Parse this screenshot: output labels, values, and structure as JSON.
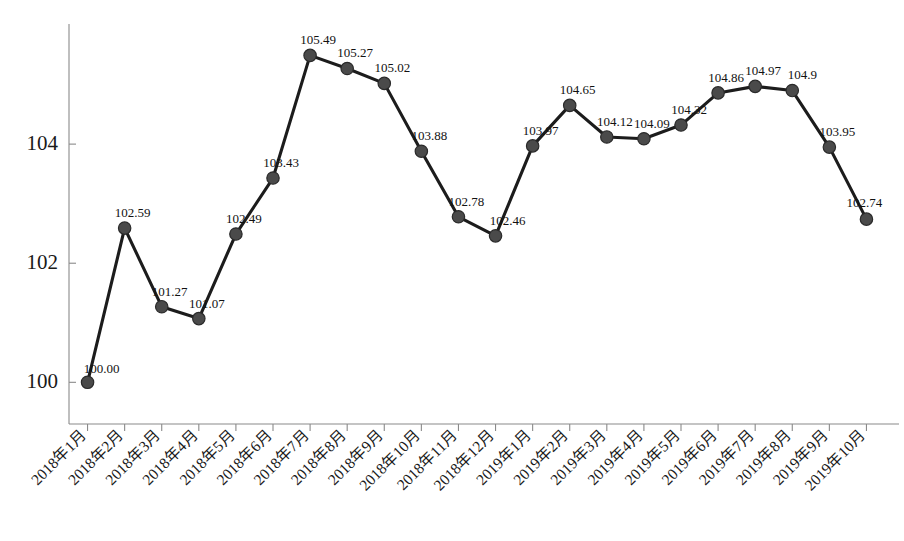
{
  "chart_data": {
    "type": "line",
    "title": "",
    "subtitle": "",
    "xlabel": "",
    "ylabel": "",
    "ylim": [
      99.3,
      105.95
    ],
    "yticks": [
      "100",
      "102",
      "104"
    ],
    "ytick_values": [
      100,
      102,
      104
    ],
    "grid": false,
    "legend": null,
    "legend_position": "none",
    "marker": "circle",
    "line_color": "#1c1c1c",
    "marker_color": "#4a4a4a",
    "categories": [
      "2018年1月",
      "2018年2月",
      "2018年3月",
      "2018年4月",
      "2018年5月",
      "2018年6月",
      "2018年7月",
      "2018年8月",
      "2018年9月",
      "2018年10月",
      "2018年11月",
      "2018年12月",
      "2019年1月",
      "2019年2月",
      "2019年3月",
      "2019年4月",
      "2019年5月",
      "2019年6月",
      "2019年7月",
      "2019年8月",
      "2019年9月",
      "2019年10月"
    ],
    "values": [
      100.0,
      102.59,
      101.27,
      101.07,
      102.49,
      103.43,
      105.49,
      105.27,
      105.02,
      103.88,
      102.78,
      102.46,
      103.97,
      104.65,
      104.12,
      104.09,
      104.32,
      104.86,
      104.97,
      104.9,
      103.95,
      102.74
    ],
    "point_labels": [
      "100.00",
      "102.59",
      "101.27",
      "101.07",
      "102.49",
      "103.43",
      "105.49",
      "105.27",
      "105.02",
      "103.88",
      "102.78",
      "102.46",
      "103.97",
      "104.65",
      "104.12",
      "104.09",
      "104.32",
      "104.86",
      "104.97",
      "104.9",
      "103.95",
      "102.74"
    ]
  }
}
